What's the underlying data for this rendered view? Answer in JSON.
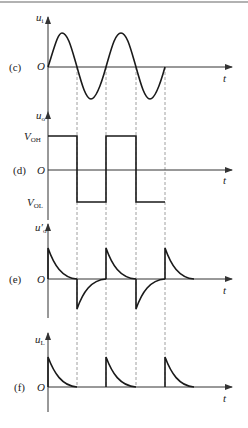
{
  "figure": {
    "panels": [
      {
        "id": "c",
        "tag": "(c)",
        "ylabel": "u",
        "ylabel_sub": "i",
        "origin": "O",
        "xlabel": "t",
        "waveform": "sine"
      },
      {
        "id": "d",
        "tag": "(d)",
        "ylabel": "u",
        "ylabel_sub": "o",
        "origin": "O",
        "xlabel": "t",
        "waveform": "square",
        "levels": {
          "high": "V",
          "high_sub": "OH",
          "low": "V",
          "low_sub": "OL"
        }
      },
      {
        "id": "e",
        "tag": "(e)",
        "ylabel": "u′",
        "ylabel_sub": "o",
        "origin": "O",
        "xlabel": "t",
        "waveform": "differentiated spikes (bipolar)"
      },
      {
        "id": "f",
        "tag": "(f)",
        "ylabel": "u",
        "ylabel_sub": "L",
        "origin": "O",
        "xlabel": "t",
        "waveform": "positive spikes only"
      }
    ],
    "colors": {
      "line": "#1a1a1a",
      "axis": "#333333",
      "dashed": "#888888",
      "border": "#999999"
    }
  }
}
